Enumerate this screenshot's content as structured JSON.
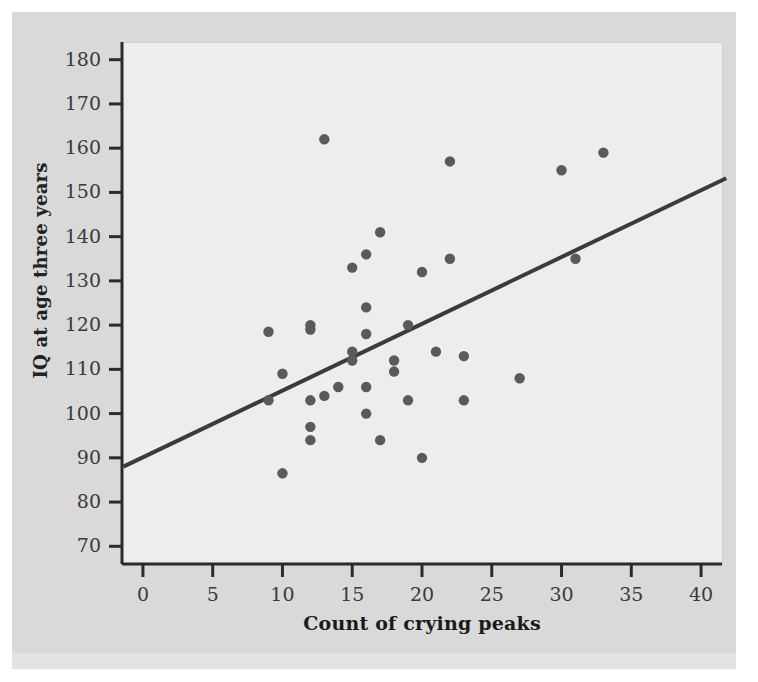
{
  "figure": {
    "background_color": "#d9d9d9",
    "panel_color": "#ededed",
    "axis_color": "#2b2b2b",
    "point_color": "#5a5a5a",
    "line_color": "#3b3b3b"
  },
  "chart_data": {
    "type": "scatter",
    "title": "",
    "xlabel": "Count of crying peaks",
    "ylabel": "IQ at age three years",
    "xlim": [
      -1.5,
      41.5
    ],
    "ylim": [
      66,
      184
    ],
    "xticks": [
      0,
      5,
      10,
      15,
      20,
      25,
      30,
      35,
      40
    ],
    "xtick_labels": [
      "0",
      "5",
      "10",
      "15",
      "20",
      "25",
      "30",
      "35",
      "40"
    ],
    "yticks": [
      70,
      80,
      90,
      100,
      110,
      120,
      130,
      140,
      150,
      160,
      170,
      180
    ],
    "ytick_labels": [
      "70",
      "80",
      "90",
      "100",
      "110",
      "120",
      "130",
      "140",
      "150",
      "160",
      "170",
      "180"
    ],
    "grid": false,
    "legend": null,
    "points": [
      {
        "x": 9,
        "y": 118.5
      },
      {
        "x": 9,
        "y": 103
      },
      {
        "x": 10,
        "y": 109
      },
      {
        "x": 10,
        "y": 86.5
      },
      {
        "x": 12,
        "y": 120
      },
      {
        "x": 12,
        "y": 119
      },
      {
        "x": 12,
        "y": 103
      },
      {
        "x": 12,
        "y": 97
      },
      {
        "x": 12,
        "y": 94
      },
      {
        "x": 13,
        "y": 162
      },
      {
        "x": 13,
        "y": 104
      },
      {
        "x": 14,
        "y": 106
      },
      {
        "x": 15,
        "y": 133
      },
      {
        "x": 15,
        "y": 114
      },
      {
        "x": 15,
        "y": 112
      },
      {
        "x": 16,
        "y": 136
      },
      {
        "x": 16,
        "y": 124
      },
      {
        "x": 16,
        "y": 118
      },
      {
        "x": 16,
        "y": 106
      },
      {
        "x": 16,
        "y": 100
      },
      {
        "x": 17,
        "y": 141
      },
      {
        "x": 17,
        "y": 94
      },
      {
        "x": 18,
        "y": 112
      },
      {
        "x": 18,
        "y": 109.5
      },
      {
        "x": 19,
        "y": 120
      },
      {
        "x": 19,
        "y": 103
      },
      {
        "x": 20,
        "y": 132
      },
      {
        "x": 20,
        "y": 90
      },
      {
        "x": 21,
        "y": 114
      },
      {
        "x": 22,
        "y": 157
      },
      {
        "x": 22,
        "y": 135
      },
      {
        "x": 23,
        "y": 113
      },
      {
        "x": 23,
        "y": 103
      },
      {
        "x": 27,
        "y": 108
      },
      {
        "x": 30,
        "y": 155
      },
      {
        "x": 31,
        "y": 135
      },
      {
        "x": 33,
        "y": 159
      }
    ],
    "trend_line": {
      "label": "regression line",
      "x_start": -1.4,
      "y_start": 88,
      "x_end": 41.8,
      "y_end": 153.2
    }
  }
}
